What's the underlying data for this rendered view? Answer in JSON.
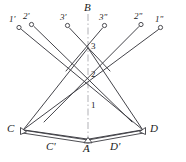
{
  "figure": {
    "kind": "optical-ray-diagram",
    "width": 186,
    "height": 162,
    "background": "#ffffff",
    "stroke_color": "#3a3a40",
    "axis_color": "#b8b8bc",
    "label_color": "#1c1c1c"
  },
  "axis": {
    "name": "optical-axis",
    "label": "B",
    "label_x": 86,
    "label_y": 4,
    "x": 88,
    "y_top": 14,
    "y_bottom": 152,
    "style": "dash-dot"
  },
  "source_points": [
    {
      "id": "r1p",
      "label": "1'",
      "cx": 19,
      "cy": 27,
      "label_x": 9,
      "label_y": 16
    },
    {
      "id": "r2p",
      "label": "2'",
      "cx": 32,
      "cy": 24,
      "label_x": 23,
      "label_y": 13
    },
    {
      "id": "r3p",
      "label": "3'",
      "cx": 68,
      "cy": 25,
      "label_x": 60,
      "label_y": 13
    },
    {
      "id": "r3pp",
      "label": "3\"",
      "cx": 104,
      "cy": 25,
      "label_x": 100,
      "label_y": 13
    },
    {
      "id": "r2pp",
      "label": "2\"",
      "cx": 141,
      "cy": 24,
      "label_x": 136,
      "label_y": 13
    },
    {
      "id": "r1pp",
      "label": "1\"",
      "cx": 161,
      "cy": 27,
      "label_x": 157,
      "label_y": 16
    }
  ],
  "axis_nodes": [
    {
      "id": "n3",
      "label": "3",
      "x": 88,
      "y": 48,
      "label_x": 91,
      "label_y": 42
    },
    {
      "id": "n2",
      "label": "2",
      "x": 88,
      "y": 76,
      "label_x": 91,
      "label_y": 70
    },
    {
      "id": "n1",
      "label": "1",
      "x": 88,
      "y": 107,
      "label_x": 91,
      "label_y": 101
    }
  ],
  "vertices": [
    {
      "id": "C",
      "label": "C",
      "x": 22,
      "y": 131,
      "label_x": 9,
      "label_y": 124
    },
    {
      "id": "D",
      "label": "D",
      "x": 144,
      "y": 131,
      "label_x": 150,
      "label_y": 124
    },
    {
      "id": "A",
      "label": "A",
      "x": 88,
      "y": 141,
      "label_x": 84,
      "label_y": 144
    },
    {
      "id": "Cp",
      "label": "C'",
      "x": 55,
      "y": 137,
      "label_x": 48,
      "label_y": 144
    },
    {
      "id": "Dp",
      "label": "D'",
      "x": 120,
      "y": 137,
      "label_x": 112,
      "label_y": 144
    }
  ],
  "rays": [
    {
      "id": "ray-1p-D",
      "from": "r1p",
      "to": "D",
      "x1": 22,
      "y1": 30,
      "x2": 143,
      "y2": 130
    },
    {
      "id": "ray-2p-Dp",
      "from": "r2p",
      "to": "n2",
      "x1": 34,
      "y1": 27,
      "x2": 131,
      "y2": 121
    },
    {
      "id": "ray-3p-n3",
      "from": "r3p",
      "to": "n3",
      "x1": 70,
      "y1": 28,
      "x2": 107,
      "y2": 68
    },
    {
      "id": "ray-3pp-n3",
      "from": "r3pp",
      "to": "n3",
      "x1": 102,
      "y1": 28,
      "x2": 69,
      "y2": 68
    },
    {
      "id": "ray-2pp-Cp",
      "from": "r2pp",
      "to": "n2",
      "x1": 139,
      "y1": 27,
      "x2": 45,
      "y2": 121
    },
    {
      "id": "ray-1pp-C",
      "from": "r1pp",
      "to": "C",
      "x1": 158,
      "y1": 30,
      "x2": 23,
      "y2": 130
    }
  ],
  "lower_rays": [
    {
      "id": "ray-C-n3",
      "x1": 23,
      "y1": 130,
      "x2": 88,
      "y2": 48
    },
    {
      "id": "ray-D-n3",
      "x1": 143,
      "y1": 130,
      "x2": 88,
      "y2": 48
    },
    {
      "id": "ray-A-C",
      "x1": 88,
      "y1": 140,
      "x2": 23,
      "y2": 130
    },
    {
      "id": "ray-A-D",
      "x1": 88,
      "y1": 140,
      "x2": 143,
      "y2": 130
    }
  ],
  "mirror_edges": [
    {
      "id": "mirror-left",
      "x1": 22,
      "y1": 131,
      "x2": 88,
      "y2": 141
    },
    {
      "id": "mirror-right",
      "x1": 88,
      "y1": 141,
      "x2": 144,
      "y2": 131
    }
  ],
  "markers": {
    "source_radius": 2.1,
    "vertex_triangle": "open-triangle",
    "node_style": "crossing"
  }
}
